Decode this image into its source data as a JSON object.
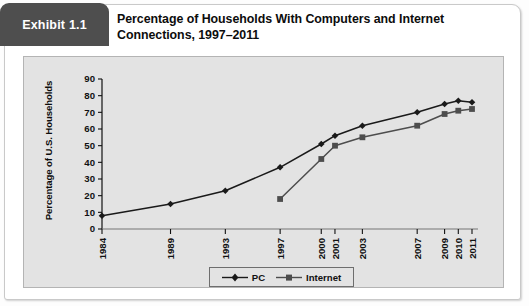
{
  "exhibit": {
    "badge_label": "Exhibit 1.1",
    "title": "Percentage of Households With Computers and Internet Connections, 1997–2011",
    "badge_color": "#4e4e4e",
    "panel_color": "#e3e3e3",
    "series_color": "#1a1a1a",
    "internet_color": "#4d4d4d"
  },
  "legend": {
    "pc_label": "PC",
    "internet_label": "Internet"
  },
  "chart_data": {
    "type": "line",
    "title": "Percentage of Households With Computers and Internet Connections, 1997–2011",
    "xlabel": "",
    "ylabel": "Percentage of U.S. Households",
    "categories": [
      "1984",
      "1989",
      "1993",
      "1997",
      "2000",
      "2001",
      "2003",
      "2007",
      "2009",
      "2010",
      "2011"
    ],
    "yticks": [
      0,
      10,
      20,
      30,
      40,
      50,
      60,
      70,
      80,
      90
    ],
    "ylim": [
      0,
      90
    ],
    "grid": false,
    "legend_position": "bottom",
    "series": [
      {
        "name": "PC",
        "marker": "diamond",
        "values": [
          8,
          15,
          23,
          37,
          51,
          56,
          62,
          70,
          75,
          77,
          76
        ]
      },
      {
        "name": "Internet",
        "marker": "square",
        "values": [
          null,
          null,
          null,
          18,
          42,
          50,
          55,
          62,
          69,
          71,
          72
        ]
      }
    ]
  }
}
